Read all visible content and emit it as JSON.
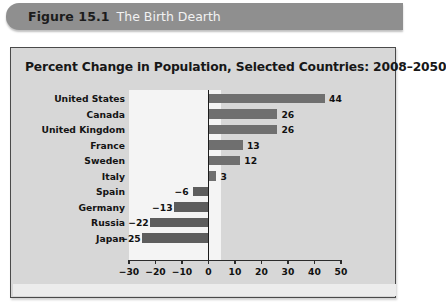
{
  "header": {
    "figure_number": "Figure 15.1",
    "caption": "The Birth Dearth",
    "banner_color": "#8f8f8f"
  },
  "panel": {
    "background_color": "#d7d7d7",
    "border_color": "#4a4a4a",
    "negative_backdrop_color": "#f4f4f4"
  },
  "chart_data": {
    "type": "bar",
    "orientation": "horizontal",
    "title": "Percent Change in Population, Selected Countries: 2008–2050",
    "xlabel": "",
    "ylabel": "",
    "categories": [
      "United States",
      "Canada",
      "United Kingdom",
      "France",
      "Sweden",
      "Italy",
      "Spain",
      "Germany",
      "Russia",
      "Japan"
    ],
    "values": [
      44,
      26,
      26,
      13,
      12,
      3,
      -6,
      -13,
      -22,
      -25
    ],
    "value_labels": [
      "44",
      "26",
      "26",
      "13",
      "12",
      "3",
      "−6",
      "−13",
      "−22",
      "−25"
    ],
    "xlim": [
      -30,
      50
    ],
    "xticks": [
      -30,
      -20,
      -10,
      0,
      10,
      20,
      30,
      40,
      50
    ],
    "xtick_labels": [
      "−30",
      "−20",
      "−10",
      "0",
      "10",
      "20",
      "30",
      "40",
      "50"
    ],
    "grid": false,
    "legend": null,
    "bar_color": "#6f6f6f",
    "negative_bar_color": "#5d5d5d",
    "zero_line_color": "#1b1b1b"
  }
}
